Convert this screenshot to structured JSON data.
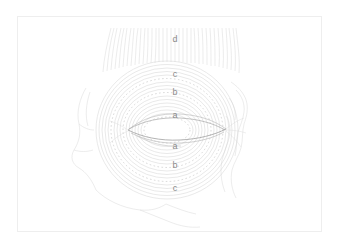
{
  "figure": {
    "background_color": "#ffffff",
    "frame_color": "#eeeeee",
    "line_color": "#cfcfcf",
    "dash_color": "#c4c4c4",
    "fissure_color": "#9a9a9a",
    "contour_color": "#d8d8d8",
    "label_color": "#8a8a8a",
    "labels": [
      {
        "text": "d",
        "x": 175,
        "y": 39,
        "name": "label-d-top"
      },
      {
        "text": "c",
        "x": 175,
        "y": 74,
        "name": "label-c-top"
      },
      {
        "text": "b",
        "x": 175,
        "y": 92,
        "name": "label-b-top"
      },
      {
        "text": "a",
        "x": 175,
        "y": 115,
        "name": "label-a-top"
      },
      {
        "text": "a",
        "x": 175,
        "y": 146,
        "name": "label-a-bottom"
      },
      {
        "text": "b",
        "x": 175,
        "y": 165,
        "name": "label-b-bottom"
      },
      {
        "text": "c",
        "x": 175,
        "y": 188,
        "name": "label-c-bottom"
      }
    ],
    "regions": {
      "a": "pars palpebralis (inner ring zone)",
      "b": "pars orbitalis inner (middle ring zone)",
      "c": "pars orbitalis outer (outer ring zone)",
      "d": "frontalis muscle fibers (vertical striations)"
    },
    "ellipse_center": {
      "x": 167,
      "y": 130
    },
    "ellipse_rx": 70,
    "ellipse_ry": 69,
    "fissure": {
      "x1": 128,
      "x2": 226,
      "y": 130
    },
    "striation_band": {
      "x1": 100,
      "x2": 242,
      "y_top": 28,
      "y_bottom": 72
    }
  }
}
